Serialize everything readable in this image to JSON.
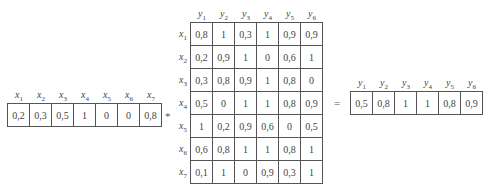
{
  "input_vector": {
    "labels": [
      "x1",
      "x2",
      "x3",
      "x4",
      "x5",
      "x6",
      "x7"
    ],
    "label_base": "x",
    "label_subs": [
      "1",
      "2",
      "3",
      "4",
      "5",
      "6",
      "7"
    ],
    "values": [
      "0,2",
      "0,3",
      "0,5",
      "1",
      "0",
      "0",
      "0,8"
    ]
  },
  "operator_compose": "*",
  "relation_matrix": {
    "col_base": "y",
    "col_subs": [
      "1",
      "2",
      "3",
      "4",
      "5",
      "6"
    ],
    "row_base": "x",
    "row_subs": [
      "1",
      "2",
      "3",
      "4",
      "5",
      "6",
      "7"
    ],
    "rows": [
      [
        "0,8",
        "1",
        "0,3",
        "1",
        "0,9",
        "0,9"
      ],
      [
        "0,2",
        "0,9",
        "1",
        "0",
        "0,6",
        "1"
      ],
      [
        "0,3",
        "0,8",
        "0,9",
        "1",
        "0,8",
        "0"
      ],
      [
        "0,5",
        "0",
        "1",
        "1",
        "0,8",
        "0,9"
      ],
      [
        "1",
        "0,2",
        "0,9",
        "0,6",
        "0",
        "0,5"
      ],
      [
        "0,6",
        "0,8",
        "1",
        "1",
        "0,8",
        "1"
      ],
      [
        "0,1",
        "1",
        "0",
        "0,9",
        "0,3",
        "1"
      ]
    ]
  },
  "operator_equals": "=",
  "result_vector": {
    "label_base": "y",
    "label_subs": [
      "1",
      "2",
      "3",
      "4",
      "5",
      "6"
    ],
    "values": [
      "0,5",
      "0,8",
      "1",
      "1",
      "0,8",
      "0,9"
    ]
  }
}
